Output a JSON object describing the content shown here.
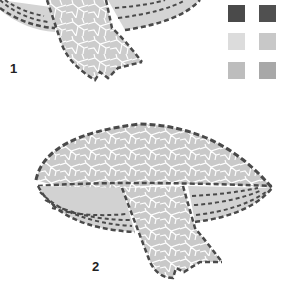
{
  "figures": [
    {
      "label": "1"
    },
    {
      "label": "2"
    }
  ],
  "palette": {
    "swatches": [
      {
        "name": "dark-grey-1",
        "color": "#4a4a4a"
      },
      {
        "name": "dark-grey-2",
        "color": "#505050"
      },
      {
        "name": "very-light-grey",
        "color": "#dcdcdc"
      },
      {
        "name": "light-grey",
        "color": "#c8c8c8"
      },
      {
        "name": "mid-light-grey",
        "color": "#bdbdbd"
      },
      {
        "name": "mid-grey",
        "color": "#a8a8a8"
      }
    ]
  },
  "colors": {
    "outline": "#4a4a4a",
    "tile_fill": "#cfcfcf",
    "grout": "#ffffff"
  }
}
